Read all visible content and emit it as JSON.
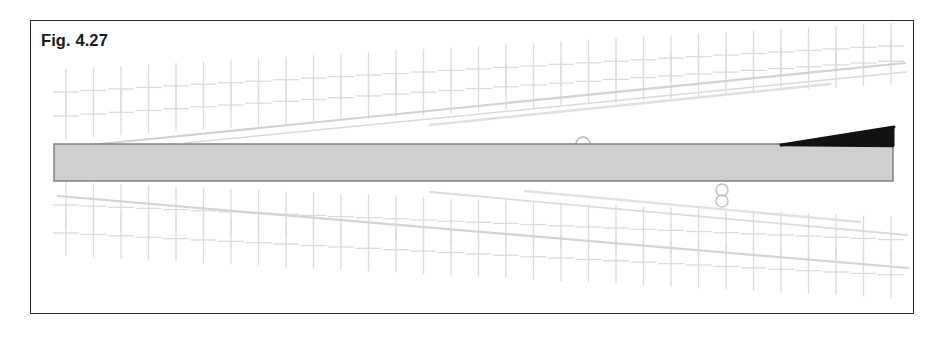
{
  "figure": {
    "caption": "Fig. 4.27",
    "frame": {
      "x": 30,
      "y": 20,
      "width": 884,
      "height": 294,
      "border_color": "#2a2a2a",
      "background_color": "#ffffff"
    },
    "beam": {
      "name": "horizontal-beam",
      "x": 54,
      "y": 144,
      "width": 839,
      "height": 37,
      "fill_color": "#cfcfcf",
      "stroke_color": "#7a7a7a"
    },
    "wedge": {
      "name": "black-wedge",
      "description": "thin black tapered wedge resting on right end of beam",
      "apex_x": 781,
      "apex_y": 145,
      "tip_x": 894,
      "tip_y": 127,
      "base_x": 894,
      "base_y": 146,
      "color": "#121212"
    },
    "markers": [
      {
        "name": "arc-marker-top",
        "cx": 583,
        "cy": 144,
        "r": 7,
        "type": "semicircle-up",
        "color": "#b6b6b6"
      },
      {
        "name": "circle-marker-lower-upper",
        "cx": 722,
        "cy": 190,
        "r": 6,
        "type": "circle",
        "color": "#c2c2c2"
      },
      {
        "name": "circle-marker-lower-lower",
        "cx": 722,
        "cy": 201,
        "r": 6,
        "type": "circle",
        "color": "#c2c2c2"
      }
    ],
    "grid": {
      "name": "faint-crosshatch-grid",
      "color": "#dcdcdc",
      "cross_spacing_x": 27.5,
      "upper_rows_y": [
        92,
        116
      ],
      "lower_rows_y": [
        205,
        233
      ],
      "vertical_tick_length": 46,
      "horizontal_tick_length": 26,
      "tilt_deg_upper": -3.2,
      "tilt_deg_lower": 2.4
    },
    "diagonals": [
      {
        "name": "upper-diagonal-line-1",
        "x1": 60,
        "y1": 148,
        "x2": 905,
        "y2": 63,
        "color": "#d2d2d2",
        "width": 2.2
      },
      {
        "name": "upper-diagonal-line-2",
        "x1": 185,
        "y1": 143,
        "x2": 906,
        "y2": 72,
        "color": "#dadada",
        "width": 1.6
      },
      {
        "name": "upper-diagonal-line-3",
        "x1": 430,
        "y1": 125,
        "x2": 830,
        "y2": 84,
        "color": "#e0e0e0",
        "width": 2.6
      },
      {
        "name": "lower-diagonal-line-1",
        "x1": 58,
        "y1": 196,
        "x2": 908,
        "y2": 268,
        "color": "#d4d4d4",
        "width": 2.2
      },
      {
        "name": "lower-diagonal-line-2",
        "x1": 430,
        "y1": 192,
        "x2": 907,
        "y2": 235,
        "color": "#dcdcdc",
        "width": 1.8
      },
      {
        "name": "lower-diagonal-line-3",
        "x1": 525,
        "y1": 191,
        "x2": 860,
        "y2": 222,
        "color": "#e2e2e2",
        "width": 2.4
      }
    ]
  }
}
